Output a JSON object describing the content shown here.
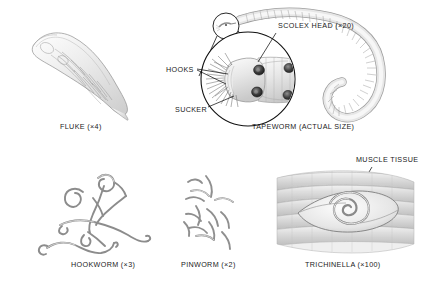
{
  "plate": {
    "title_visible": false,
    "background_color": "#ffffff",
    "ink_color": "#1a1a1a",
    "specimens": [
      {
        "id": "fluke",
        "caption": "FLUKE (×4)",
        "magnification": "×4",
        "caption_x": 60,
        "caption_y": 124,
        "shape": "leaf-shaped flattened body, diagonal orientation, internal branched gut visible"
      },
      {
        "id": "tapeworm",
        "caption": "TAPEWORM (ACTUAL SIZE)",
        "magnification": "actual size",
        "caption_x": 252,
        "caption_y": 124,
        "shape": "long segmented proglottid chain curving in a hook"
      },
      {
        "id": "hookworm",
        "caption": "HOOKWORM (×3)",
        "magnification": "×3",
        "caption_x": 71,
        "caption_y": 262,
        "shape": "tangle of slender coiled worms"
      },
      {
        "id": "pinworm",
        "caption": "PINWORM (×2)",
        "magnification": "×2",
        "caption_x": 181,
        "caption_y": 262,
        "shape": "scattered cluster of short curved worms"
      },
      {
        "id": "trichinella",
        "caption": "TRICHINELLA (×100)",
        "magnification": "×100",
        "caption_x": 305,
        "caption_y": 262,
        "shape": "coiled larva encysted within banded muscle fibers"
      }
    ],
    "callouts": [
      {
        "id": "scolex-head",
        "text": "SCOLEX HEAD (×20)",
        "x": 278,
        "y": 27,
        "magnification": "×20",
        "points_to": "magnified scolex circle"
      },
      {
        "id": "hooks",
        "text": "HOOKS",
        "x": 166,
        "y": 70,
        "points_to": "radiating hooks on scolex rostellum"
      },
      {
        "id": "sucker",
        "text": "SUCKER",
        "x": 175,
        "y": 110,
        "points_to": "dark circular sucker on scolex"
      },
      {
        "id": "muscle-tissue",
        "text": "MUSCLE TISSUE",
        "x": 356,
        "y": 160,
        "points_to": "striated muscle fiber band"
      }
    ]
  }
}
